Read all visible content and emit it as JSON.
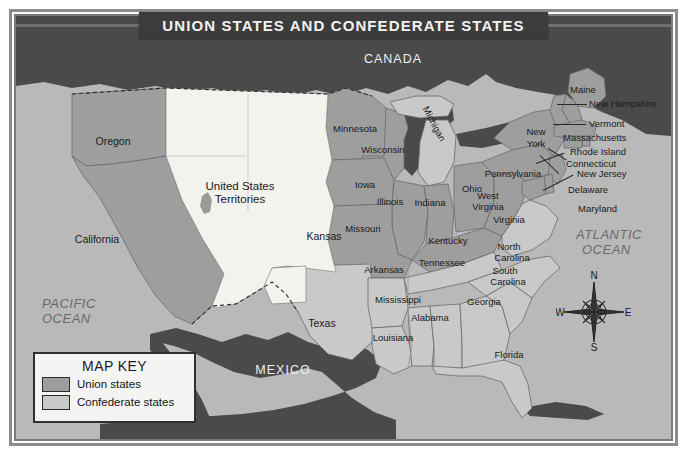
{
  "map": {
    "title": "Union States and Confederate States",
    "key": {
      "heading": "MAP KEY",
      "entries": [
        {
          "label": "Union states",
          "color": "#9e9e9e"
        },
        {
          "label": "Confederate states",
          "color": "#c9c9c9"
        }
      ]
    },
    "colors": {
      "union": "#9e9e9e",
      "confederate": "#c9c9c9",
      "territories": "#f3f3ee",
      "foreign": "#4a4a4a",
      "water": "#b9b9b9",
      "banner": "#3c3c3c",
      "banner_text": "#f2f2f2",
      "border": "#2a2a2a"
    },
    "compass": {
      "north": "N",
      "east": "E",
      "south": "S",
      "west": "W"
    },
    "oceans": [
      {
        "name": "PACIFIC OCEAN",
        "line1": "PACIFIC",
        "line2": "OCEAN"
      },
      {
        "name": "ATLANTIC OCEAN",
        "line1": "ATLANTIC",
        "line2": "OCEAN"
      }
    ],
    "countries": [
      {
        "name": "CANADA"
      },
      {
        "name": "MEXICO"
      }
    ],
    "territories_label": {
      "line1": "United States",
      "line2": "Territories"
    },
    "union_states": [
      "Oregon",
      "California",
      "Kansas",
      "Minnesota",
      "Wisconsin",
      "Michigan",
      "Iowa",
      "Illinois",
      "Indiana",
      "Ohio",
      "Missouri",
      "Kentucky",
      "West Virginia",
      "Pennsylvania",
      "New York",
      "Maine",
      "New Hampshire",
      "Vermont",
      "Massachusetts",
      "Rhode Island",
      "Connecticut",
      "New Jersey",
      "Delaware",
      "Maryland"
    ],
    "confederate_states": [
      "Texas",
      "Arkansas",
      "Louisiana",
      "Mississippi",
      "Alabama",
      "Tennessee",
      "Georgia",
      "Florida",
      "South Carolina",
      "North Carolina",
      "Virginia"
    ],
    "labels": {
      "oregon": "Oregon",
      "california": "California",
      "kansas": "Kansas",
      "texas": "Texas",
      "minnesota": "Minnesota",
      "wisconsin": "Wisconsin",
      "michigan": "Michigan",
      "iowa": "Iowa",
      "illinois": "Illinois",
      "indiana": "Indiana",
      "ohio": "Ohio",
      "missouri": "Missouri",
      "kentucky": "Kentucky",
      "arkansas": "Arkansas",
      "tennessee": "Tennessee",
      "mississippi": "Mississippi",
      "alabama": "Alabama",
      "louisiana": "Louisiana",
      "georgia": "Georgia",
      "florida": "Florida",
      "south_carolina_l1": "South",
      "south_carolina_l2": "Carolina",
      "north_carolina_l1": "North",
      "north_carolina_l2": "Carolina",
      "virginia": "Virginia",
      "west_virginia_l1": "West",
      "west_virginia_l2": "Virginia",
      "pennsylvania": "Pennsylvania",
      "new_york_l1": "New",
      "new_york_l2": "York",
      "maine": "Maine",
      "new_hampshire": "New Hampshire",
      "vermont": "Vermont",
      "massachusetts": "Massachusetts",
      "rhode_island": "Rhode Island",
      "connecticut": "Connecticut",
      "new_jersey": "New Jersey",
      "delaware": "Delaware",
      "maryland": "Maryland"
    }
  }
}
